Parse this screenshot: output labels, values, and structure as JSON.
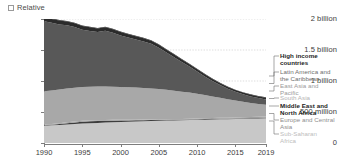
{
  "controls": {
    "relative_checkbox_label": "Relative",
    "relative_checked": false
  },
  "chart_data": {
    "type": "area",
    "stacked": true,
    "title": "",
    "subtitle": "",
    "xlabel": "",
    "ylabel": "",
    "grid": true,
    "legend_position": "right",
    "xlim": [
      1990,
      2019
    ],
    "ylim": [
      0,
      2000000000
    ],
    "x": [
      1990,
      1991,
      1992,
      1993,
      1994,
      1995,
      1996,
      1997,
      1998,
      1999,
      2000,
      2001,
      2002,
      2003,
      2004,
      2005,
      2006,
      2007,
      2008,
      2009,
      2010,
      2011,
      2012,
      2013,
      2014,
      2015,
      2016,
      2017,
      2018,
      2019
    ],
    "xtick_labels": [
      "1990",
      "1995",
      "2000",
      "2005",
      "2010",
      "2015",
      "2019"
    ],
    "xticks": [
      1990,
      1995,
      2000,
      2005,
      2010,
      2015,
      2019
    ],
    "ytick_labels": [
      "0",
      "500 million",
      "1 billion",
      "1.5 billion",
      "2 billion"
    ],
    "yticks": [
      0,
      500000000,
      1000000000,
      1500000000,
      2000000000
    ],
    "series": [
      {
        "name": "Sub-Saharan Africa",
        "color": "#c8c8c8",
        "values": [
          278000000,
          285000000,
          292000000,
          299000000,
          306000000,
          313000000,
          319000000,
          324000000,
          329000000,
          334000000,
          338000000,
          342000000,
          346000000,
          350000000,
          354000000,
          358000000,
          361000000,
          364000000,
          367000000,
          370000000,
          373000000,
          376000000,
          379000000,
          382000000,
          385000000,
          388000000,
          391000000,
          394000000,
          397000000,
          400000000
        ]
      },
      {
        "name": "Europe and Central Asia",
        "color": "#3d3d3d",
        "values": [
          7000000,
          9000000,
          14000000,
          20000000,
          26000000,
          30000000,
          31000000,
          30000000,
          28000000,
          26000000,
          23000000,
          21000000,
          19000000,
          17000000,
          15000000,
          13000000,
          12000000,
          11000000,
          10000000,
          11000000,
          11000000,
          10000000,
          9000000,
          9000000,
          8000000,
          8000000,
          8000000,
          8000000,
          8000000,
          8000000
        ]
      },
      {
        "name": "Middle East and North Africa",
        "color": "#9e9e9e",
        "values": [
          14000000,
          14000000,
          14000000,
          14000000,
          14000000,
          14000000,
          13000000,
          13000000,
          13000000,
          13000000,
          13000000,
          12000000,
          12000000,
          12000000,
          12000000,
          12000000,
          11000000,
          11000000,
          11000000,
          12000000,
          12000000,
          13000000,
          14000000,
          15000000,
          16000000,
          17000000,
          18000000,
          19000000,
          20000000,
          21000000
        ]
      },
      {
        "name": "South Asia",
        "color": "#a8a8a8",
        "values": [
          536000000,
          540000000,
          543000000,
          545000000,
          546000000,
          546000000,
          545000000,
          543000000,
          540000000,
          536000000,
          531000000,
          525000000,
          518000000,
          510000000,
          500000000,
          488000000,
          474000000,
          458000000,
          440000000,
          420000000,
          398000000,
          374000000,
          349000000,
          323000000,
          297000000,
          272000000,
          248000000,
          226000000,
          206000000,
          188000000
        ]
      },
      {
        "name": "East Asia and Pacific",
        "color": "#585858",
        "values": [
          1130000000,
          1090000000,
          1050000000,
          1020000000,
          980000000,
          925000000,
          900000000,
          880000000,
          900000000,
          870000000,
          830000000,
          800000000,
          775000000,
          750000000,
          720000000,
          665000000,
          600000000,
          540000000,
          480000000,
          420000000,
          360000000,
          300000000,
          250000000,
          205000000,
          170000000,
          140000000,
          120000000,
          105000000,
          93000000,
          85000000
        ]
      },
      {
        "name": "Latin America and the Caribbean",
        "color": "#2b2b2b",
        "values": [
          63000000,
          62000000,
          61000000,
          60000000,
          59000000,
          58000000,
          57000000,
          56000000,
          55000000,
          55000000,
          54000000,
          53000000,
          52000000,
          51000000,
          50000000,
          48000000,
          45000000,
          42000000,
          39000000,
          38000000,
          36000000,
          34000000,
          32000000,
          30000000,
          29000000,
          28000000,
          28000000,
          27000000,
          27000000,
          27000000
        ]
      },
      {
        "name": "High income countries",
        "color": "#111111",
        "values": [
          10000000,
          10000000,
          10000000,
          10000000,
          10000000,
          10000000,
          9000000,
          9000000,
          9000000,
          9000000,
          9000000,
          9000000,
          8000000,
          8000000,
          8000000,
          8000000,
          8000000,
          8000000,
          8000000,
          8000000,
          8000000,
          8000000,
          8000000,
          8000000,
          7000000,
          7000000,
          7000000,
          7000000,
          7000000,
          7000000
        ]
      }
    ],
    "totals": [
      2038000000,
      2010000000,
      1984000000,
      1968000000,
      1941000000,
      1894000000,
      1874000000,
      1855000000,
      1874000000,
      1843000000,
      1798000000,
      1762000000,
      1730000000,
      1698000000,
      1659000000,
      1592000000,
      1511000000,
      1434000000,
      1355000000,
      1279000000,
      1198000000,
      1115000000,
      1041000000,
      972000000,
      912000000,
      860000000,
      820000000,
      786000000,
      758000000,
      736000000
    ]
  },
  "legend": {
    "entries": [
      {
        "label": "High income\ncountries",
        "color": "#1c1c1c",
        "bold": true
      },
      {
        "label": "Latin America and\nthe Caribbean",
        "color": "#6e6e6e",
        "bold": false
      },
      {
        "label": "East Asia and\nPacific",
        "color": "#9a9a9a",
        "bold": false
      },
      {
        "label": "South Asia",
        "color": "#b4b4b4",
        "bold": false
      },
      {
        "label": "Middle East and\nNorth Africa",
        "color": "#1c1c1c",
        "bold": true
      },
      {
        "label": "Europe and Central\nAsia",
        "color": "#8e8e8e",
        "bold": false
      },
      {
        "label": "Sub-Saharan\nAfrica",
        "color": "#bdbdbd",
        "bold": false
      }
    ]
  }
}
